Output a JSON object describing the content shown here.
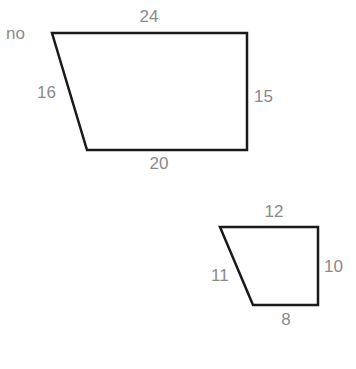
{
  "caption": "no",
  "figures": [
    {
      "name": "large-trapezoid",
      "sides": {
        "top": "24",
        "right": "15",
        "bottom": "20",
        "left": "16"
      }
    },
    {
      "name": "small-trapezoid",
      "sides": {
        "top": "12",
        "right": "10",
        "bottom": "8",
        "left": "11"
      }
    }
  ],
  "colors": {
    "stroke": "#1a1a1a",
    "label": "#8a8a8a"
  }
}
